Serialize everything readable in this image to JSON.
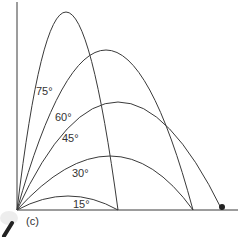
{
  "figure": {
    "caption": "(c)",
    "colors": {
      "line": "#3a3a3a",
      "background": "#ffffff",
      "ball": "#222222"
    }
  },
  "axes": {
    "origin": [
      17,
      210
    ],
    "x_end": 238,
    "y_top": 2
  },
  "trajectories": [
    {
      "angle": "15°",
      "label": "15°",
      "range_x": 118,
      "peak": [
        68,
        196
      ],
      "label_pos": [
        73,
        199
      ]
    },
    {
      "angle": "30°",
      "label": "30°",
      "range_x": 193,
      "peak": [
        110,
        156
      ],
      "label_pos": [
        72,
        168
      ]
    },
    {
      "angle": "45°",
      "label": "45°",
      "range_x": 222,
      "peak": [
        118,
        102
      ],
      "label_pos": [
        62,
        133
      ]
    },
    {
      "angle": "60°",
      "label": "60°",
      "range_x": 193,
      "peak": [
        106,
        50
      ],
      "label_pos": [
        55,
        112
      ]
    },
    {
      "angle": "75°",
      "label": "75°",
      "range_x": 118,
      "peak": [
        66,
        12
      ],
      "label_pos": [
        36,
        86
      ]
    }
  ],
  "ball": {
    "x": 222,
    "y": 207
  }
}
